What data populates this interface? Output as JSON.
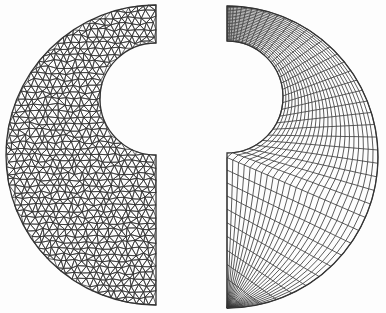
{
  "figure": {
    "description": "Two finite element meshes of a semicircular disc with a circular notch: unstructured triangular mesh (left) and structured quadrilateral polar mesh (right)",
    "line_color": "#333333",
    "background": "#fdfdfd",
    "left_mesh": {
      "type": "triangular-unstructured",
      "edge_x": 156,
      "center_y": 155,
      "outer_radius": 150,
      "notch_center_y": 99,
      "notch_radius": 56,
      "spacing": 7.2
    },
    "right_mesh": {
      "type": "quadrilateral-structured",
      "edge_x": 227,
      "center_y": 157,
      "outer_radius": 151,
      "notch_center_y": 97,
      "notch_radius": 56,
      "radial_divisions": 24,
      "angular_divisions": 44
    }
  }
}
